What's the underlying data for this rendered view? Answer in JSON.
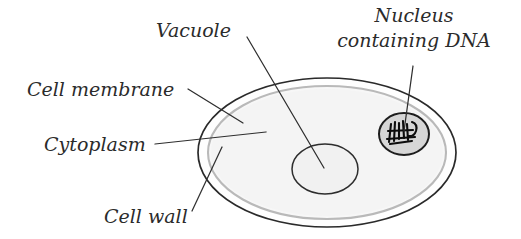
{
  "figure": {
    "background_color": "#ffffff",
    "ink_color": "#2b2b2b"
  },
  "labels": {
    "vacuole": "Vacuole",
    "nucleus_line1": "Nucleus",
    "nucleus_line2": "containing DNA",
    "cell_membrane": "Cell membrane",
    "cytoplasm": "Cytoplasm",
    "cell_wall": "Cell wall"
  },
  "structures": {
    "cell_wall": {
      "name": "cell wall",
      "stroke_color": "#2a2a2a",
      "fill_color": "#fefefe"
    },
    "cell_membrane": {
      "name": "cell membrane",
      "stroke_color": "#b9b9b9",
      "fill_color": "#f7f7f7"
    },
    "cytoplasm": {
      "name": "cytoplasm",
      "fill_color": "#f4f4f4"
    },
    "vacuole": {
      "name": "vacuole",
      "stroke_color": "#2d2d2d",
      "fill_color": "#f1f1f1"
    },
    "nucleus": {
      "name": "nucleus containing DNA",
      "stroke_color": "#1d1d1d",
      "fill_color": "#d6d6d6",
      "dna_color": "#0d0d0d"
    }
  }
}
